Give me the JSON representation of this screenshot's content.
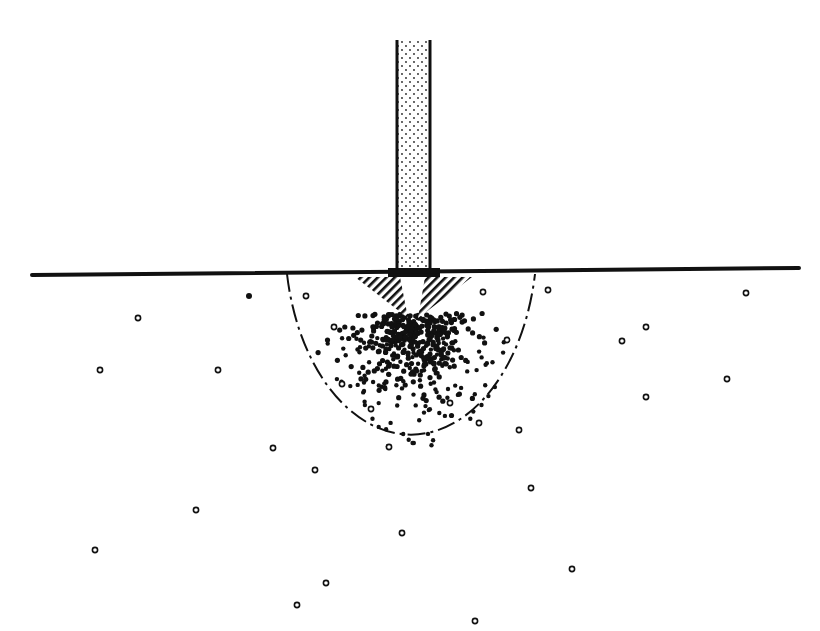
{
  "canvas": {
    "width": 820,
    "height": 631,
    "background": "#ffffff",
    "ink": "#111111"
  },
  "surface_line": {
    "x1": 32,
    "y1": 275,
    "x2": 799,
    "y2": 268,
    "stroke_width": 4
  },
  "probe_bar": {
    "x": 397,
    "y": 40,
    "width": 33,
    "height": 232,
    "fill": "stippled"
  },
  "base_cap": {
    "x": 388,
    "y": 268,
    "width": 52,
    "height": 9
  },
  "hatched_wedges": [
    {
      "side": "left",
      "points": "355,277 400,277 408,318"
    },
    {
      "side": "right",
      "points": "425,277 472,277 418,318"
    }
  ],
  "influence_zone": {
    "cx": 411,
    "cy": 272,
    "rx": 126,
    "ry": 195,
    "style": "dash-dot"
  },
  "open_circles": [
    [
      138,
      318
    ],
    [
      100,
      370
    ],
    [
      218,
      370
    ],
    [
      273,
      448
    ],
    [
      315,
      470
    ],
    [
      196,
      510
    ],
    [
      95,
      550
    ],
    [
      326,
      583
    ],
    [
      297,
      605
    ],
    [
      548,
      290
    ],
    [
      746,
      293
    ],
    [
      646,
      327
    ],
    [
      622,
      341
    ],
    [
      727,
      379
    ],
    [
      646,
      397
    ],
    [
      531,
      488
    ],
    [
      402,
      533
    ],
    [
      572,
      569
    ],
    [
      475,
      621
    ],
    [
      306,
      296
    ],
    [
      334,
      327
    ],
    [
      342,
      384
    ],
    [
      371,
      409
    ],
    [
      389,
      447
    ],
    [
      483,
      292
    ],
    [
      507,
      340
    ],
    [
      450,
      403
    ],
    [
      479,
      423
    ],
    [
      519,
      430
    ]
  ],
  "filled_circles_outside": [
    [
      249,
      296
    ]
  ],
  "dense_cluster": {
    "cx": 411,
    "cy": 320,
    "spread_x": 55,
    "spread_y": 45,
    "count": 320,
    "seed": 7
  },
  "sparse_cluster": {
    "cx": 411,
    "cy": 350,
    "spread_x": 110,
    "spread_y": 85,
    "count": 140,
    "seed": 13
  }
}
